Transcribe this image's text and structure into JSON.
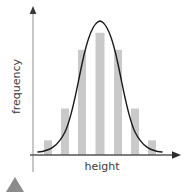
{
  "figure": {
    "name": "normal-distribution-histogram",
    "background_color": "#ffffff"
  },
  "axes": {
    "y": {
      "label": "frequency",
      "color": "#b9b9b9",
      "arrow_color": "#3a3a3a",
      "x_px": 33,
      "top_px": 8,
      "bottom_px": 172
    },
    "x": {
      "label": "height",
      "color": "#555555",
      "arrow_color": "#2b2b2b",
      "y_px": 155,
      "left_px": 30,
      "right_px": 180
    }
  },
  "marker": {
    "name": "triangle-marker",
    "color": "#8c8c8c",
    "shape": "triangle-up"
  },
  "curve": {
    "name": "bell-curve",
    "color": "#1a1a1a",
    "stroke_width": 1.4,
    "type": "normal-distribution"
  },
  "chart_data": {
    "type": "bar",
    "title": "",
    "subtitle": "",
    "xlabel": "height",
    "ylabel": "frequency",
    "grid": false,
    "legend": false,
    "bar_color": "#c9c9c9",
    "categories": [
      "1",
      "2",
      "3",
      "4",
      "5",
      "6",
      "7"
    ],
    "values": [
      12,
      38,
      86,
      100,
      86,
      38,
      12
    ],
    "ylim": [
      0,
      108
    ],
    "xlim": [
      0,
      8
    ],
    "overlay": {
      "type": "line",
      "name": "normal-curve",
      "color": "#1a1a1a",
      "mean": 4,
      "peak": 104,
      "x": [
        0.2,
        0.8,
        1.4,
        2.0,
        2.6,
        3.2,
        3.6,
        4.0,
        4.4,
        4.8,
        5.4,
        6.0,
        6.6,
        7.2,
        7.8
      ],
      "y": [
        3,
        7,
        16,
        34,
        62,
        88,
        100,
        104,
        100,
        88,
        62,
        34,
        16,
        7,
        3
      ]
    },
    "annotations": []
  }
}
